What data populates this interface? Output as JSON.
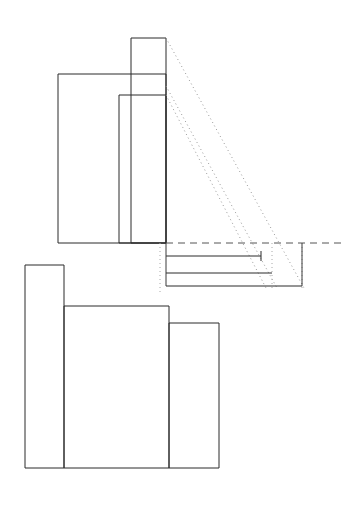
{
  "document": {
    "title": "Technical Line Drawing",
    "type": "orthographic-projection-sketch",
    "width": 348,
    "height": 506,
    "background_color": "#ffffff",
    "line_color": "#2b2b2b",
    "dashed_color": "#555555",
    "dotted_color": "#9a9a9a"
  },
  "geometry": {
    "upper_view": {
      "name": "upper-front-view",
      "baseline_y": 243,
      "shapes": [
        {
          "name": "tall-narrow-rect",
          "points": "131,38 166,38 166,243 131,243",
          "closed": true,
          "style": "solid"
        },
        {
          "name": "large-left-rect",
          "points": "58,74 166,74 166,243 58,243",
          "closed": true,
          "style": "solid"
        },
        {
          "name": "middle-rect",
          "points": "119,95 166,95 166,243 119,243",
          "closed": true,
          "style": "solid"
        }
      ]
    },
    "projection_lines": {
      "name": "projection-rays",
      "style": "dotted",
      "rays": [
        {
          "name": "projection-ray-top",
          "x1": 166,
          "y1": 38,
          "x2": 304,
          "y2": 288
        },
        {
          "name": "projection-ray-middle",
          "x1": 166,
          "y1": 86,
          "x2": 277,
          "y2": 288
        },
        {
          "name": "projection-ray-lower",
          "x1": 166,
          "y1": 95,
          "x2": 266,
          "y2": 288
        }
      ]
    },
    "right_detail": {
      "name": "right-side-detail",
      "baseline": {
        "name": "reference-baseline",
        "x1": 166,
        "y1": 243,
        "x2": 345,
        "y2": 243,
        "style": "dashed"
      },
      "vertical_guides": [
        {
          "name": "guide-left",
          "x1": 160,
          "y1": 243,
          "x2": 160,
          "y2": 292,
          "style": "dotted"
        },
        {
          "name": "guide-inner",
          "x1": 272,
          "y1": 243,
          "x2": 272,
          "y2": 288,
          "style": "dotted"
        },
        {
          "name": "guide-right",
          "x1": 302,
          "y1": 243,
          "x2": 302,
          "y2": 290,
          "style": "dotted"
        }
      ],
      "horizontals": [
        {
          "name": "detail-line-1",
          "x1": 166,
          "y1": 256,
          "x2": 261,
          "y2": 256,
          "style": "solid"
        },
        {
          "name": "detail-line-2",
          "x1": 166,
          "y1": 273,
          "x2": 272,
          "y2": 273,
          "style": "solid"
        },
        {
          "name": "detail-line-3",
          "x1": 166,
          "y1": 286,
          "x2": 302,
          "y2": 286,
          "style": "solid"
        }
      ],
      "connectors": [
        {
          "name": "connector-tick-1",
          "x1": 261,
          "y1": 251,
          "x2": 261,
          "y2": 261,
          "style": "solid"
        },
        {
          "name": "connector-edge-right",
          "x1": 302,
          "y1": 243,
          "x2": 302,
          "y2": 286,
          "style": "solid"
        }
      ]
    },
    "lower_view": {
      "name": "lower-plan-view",
      "baseline_y": 468,
      "outline": "25,265 64,265 64,306 169,306 169,323 219,323 219,468 25,468",
      "shapes": [
        {
          "name": "left-tall-rect",
          "points": "25,265 64,265 64,468 25,468",
          "closed": true,
          "style": "solid"
        },
        {
          "name": "center-rect",
          "points": "64,306 169,306 169,468 64,468",
          "closed": true,
          "style": "solid"
        },
        {
          "name": "right-rect",
          "points": "169,323 219,323 219,468 169,468",
          "closed": true,
          "style": "solid"
        }
      ]
    }
  },
  "labels": {
    "visible_text": []
  }
}
